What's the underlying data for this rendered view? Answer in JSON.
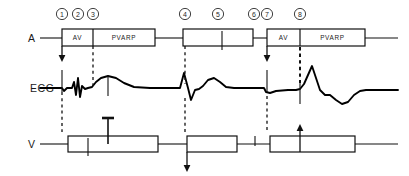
{
  "figure": {
    "background": "#ffffff",
    "ink": "#111111"
  },
  "rows": [
    {
      "id": "atrial",
      "label": "A",
      "label_x": 28,
      "label_y": 42,
      "baseline_y": 38
    },
    {
      "id": "ecg",
      "label": "ECG",
      "label_x": 30,
      "label_y": 92,
      "baseline_y": 88
    },
    {
      "id": "ventricular",
      "label": "V",
      "label_x": 28,
      "label_y": 148,
      "baseline_y": 144
    }
  ],
  "markers": [
    {
      "number": "1",
      "x": 62,
      "y": 14
    },
    {
      "number": "2",
      "x": 78,
      "y": 14
    },
    {
      "number": "3",
      "x": 93,
      "y": 14
    },
    {
      "number": "4",
      "x": 185,
      "y": 14
    },
    {
      "number": "5",
      "x": 218,
      "y": 14
    },
    {
      "number": "6",
      "x": 254,
      "y": 14
    },
    {
      "number": "7",
      "x": 267,
      "y": 14
    },
    {
      "number": "8",
      "x": 300,
      "y": 14
    }
  ],
  "atrial_channel": {
    "baseline_y": 38,
    "lead_in": {
      "x1": 40,
      "x2": 62
    },
    "lead_out": {
      "x1": 365,
      "x2": 398
    },
    "boxes": [
      {
        "id": "a-box-1",
        "x": 62,
        "width": 93,
        "y": 29,
        "height": 17,
        "segments": [
          {
            "label": "AV",
            "x1": 62,
            "x2": 93
          },
          {
            "label": "PVARP",
            "x1": 93,
            "x2": 155
          }
        ],
        "ticks": []
      },
      {
        "id": "a-box-2",
        "x": 183,
        "width": 70,
        "y": 29,
        "height": 17,
        "segments": [],
        "ticks": [
          222
        ]
      },
      {
        "id": "a-box-3",
        "x": 267,
        "width": 98,
        "y": 29,
        "height": 17,
        "segments": [
          {
            "label": "AV",
            "x1": 267,
            "x2": 300
          },
          {
            "label": "PVARP",
            "x1": 300,
            "x2": 365
          }
        ],
        "ticks": []
      }
    ],
    "connectors": [
      {
        "x1": 155,
        "x2": 183
      },
      {
        "x1": 253,
        "x2": 267
      }
    ]
  },
  "ventricular_channel": {
    "baseline_y": 144,
    "lead_in": {
      "x1": 40,
      "x2": 68
    },
    "lead_out": {
      "x1": 355,
      "x2": 398
    },
    "boxes": [
      {
        "id": "v-box-1",
        "x": 68,
        "width": 90,
        "y": 136,
        "height": 16,
        "ticks": [
          88
        ]
      },
      {
        "id": "v-box-2",
        "x": 187,
        "width": 50,
        "y": 136,
        "height": 16,
        "ticks": []
      },
      {
        "id": "v-box-3",
        "x": 270,
        "width": 85,
        "y": 136,
        "height": 16,
        "ticks": []
      }
    ],
    "connectors": [
      {
        "x1": 158,
        "x2": 187
      },
      {
        "x1": 237,
        "x2": 270
      }
    ],
    "free_ticks": [
      255
    ]
  },
  "event_lines": {
    "dashed": [
      {
        "id": "dash-a1-to-v",
        "x": 62,
        "y1": 92,
        "y2": 132,
        "weight": "thin"
      },
      {
        "id": "dash-a3-to-ecg",
        "x": 93,
        "y1": 46,
        "y2": 86,
        "weight": "thin"
      },
      {
        "id": "dash-4-a-to-ecg",
        "x": 185,
        "y1": 46,
        "y2": 84,
        "weight": "thin"
      },
      {
        "id": "dash-4-ecg-to-v",
        "x": 185,
        "y1": 98,
        "y2": 133,
        "weight": "thin"
      },
      {
        "id": "dash-7-ecg-to-v",
        "x": 267,
        "y1": 96,
        "y2": 132,
        "weight": "thin"
      },
      {
        "id": "dash-8-a-to-ecg",
        "x": 300,
        "y1": 47,
        "y2": 84,
        "weight": "thick"
      }
    ],
    "arrows": [
      {
        "id": "arrow-atrial-pace-1",
        "x": 62,
        "y_from": 46,
        "y_to": 62,
        "direction": "down"
      },
      {
        "id": "arrow-atrial-pace-7",
        "x": 267,
        "y_from": 46,
        "y_to": 62,
        "direction": "down"
      },
      {
        "id": "arrow-v-sense-down",
        "x": 187,
        "y_from": 152,
        "y_to": 172,
        "direction": "down"
      },
      {
        "id": "arrow-v-pace-up",
        "x": 300,
        "y_from": 152,
        "y_to": 124,
        "direction": "up"
      }
    ],
    "spikes": [
      {
        "id": "spike-a-pace-1",
        "x": 62,
        "y1": 70,
        "y2": 92
      },
      {
        "id": "spike-v-pace-1",
        "x": 108,
        "y1": 76,
        "y2": 96
      },
      {
        "id": "spike-a-pace-3",
        "x": 267,
        "y1": 70,
        "y2": 92
      },
      {
        "id": "spike-v-pace-3",
        "x": 300,
        "y1": 84,
        "y2": 104
      }
    ],
    "t_markers": [
      {
        "id": "t-marker-crosstalk",
        "x": 108,
        "y_top": 118,
        "y_bottom": 144,
        "cap_half_width": 6
      }
    ]
  },
  "ecg_channel": {
    "baseline_y": 88,
    "path": "M 40 88 L 60 88 L 62 88 L 64 91 L 67 88 L 72 88 L 74 82 L 76 95 L 78 78 L 80 97 L 82 86 L 85 89 L 88 88 L 92 87 L 96 82 L 101 78 L 108 76 L 116 78 L 124 83 L 134 87 L 150 88 L 170 88 L 180 88 L 184 73 L 188 88 L 191 100 L 195 90 L 199 89 L 203 86 L 208 80 L 214 78 L 220 82 L 226 87 L 234 88 L 258 88 L 264 88 L 266 92 L 270 93 L 276 91 L 288 90 L 296 90 L 300 89 L 304 84 L 308 75 L 312 66 L 316 78 L 320 90 L 325 95 L 330 95 L 336 100 L 342 104 L 348 102 L 354 95 L 360 91 L 366 90 L 380 90 L 398 90",
    "features": [
      {
        "name": "paced-atrial-beat-1",
        "marker": "1"
      },
      {
        "name": "qrs-complex-1",
        "marker": "2"
      },
      {
        "name": "t-wave-1",
        "marker": "3"
      },
      {
        "name": "intrinsic-qrs-2",
        "marker": "4"
      },
      {
        "name": "t-wave-2",
        "marker": "5"
      },
      {
        "name": "paced-atrial-beat-3",
        "marker": "7"
      },
      {
        "name": "paced-ventricular-beat-3",
        "marker": "8"
      }
    ]
  }
}
